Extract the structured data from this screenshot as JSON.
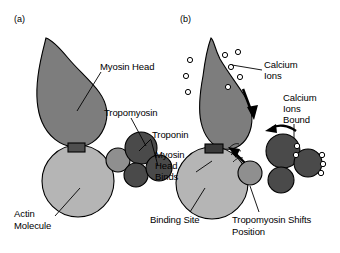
{
  "figure": {
    "background_color": "#ffffff",
    "width": 340,
    "height": 253
  },
  "colors": {
    "myosin_gray": "#7d7d7d",
    "actin_light_gray": "#b5b5b5",
    "troponin_dark": "#4a4a4a",
    "tropomyosin_mid": "#8a8a8a",
    "binding_site_dark": "#3a3a3a",
    "outline": "#000000",
    "text": "#000000"
  },
  "panels": [
    {
      "id": "a",
      "label": "(a)",
      "state": "relaxed",
      "labels": [
        {
          "name": "myosin-head-label",
          "text": "Myosin Head"
        },
        {
          "name": "tropomyosin-label",
          "text": "Tropomyosin"
        },
        {
          "name": "troponin-label",
          "text": "Troponin"
        },
        {
          "name": "actin-molecule-label",
          "text": "Actin\nMolecule"
        }
      ]
    },
    {
      "id": "b",
      "label": "(b)",
      "state": "contracted",
      "labels": [
        {
          "name": "calcium-ions-label",
          "text": "Calcium\nIons"
        },
        {
          "name": "calcium-ions-bound-label",
          "text": "Calcium\nIons\nBound"
        },
        {
          "name": "myosin-head-binds-label",
          "text": "Myosin\nHead\nBinds"
        },
        {
          "name": "binding-site-label",
          "text": "Binding Site"
        },
        {
          "name": "tropomyosin-shifts-label",
          "text": "Tropomyosin Shifts\nPosition"
        }
      ]
    }
  ],
  "text": {
    "panel_a_label": "(a)",
    "panel_b_label": "(b)",
    "myosin_head": "Myosin Head",
    "tropomyosin": "Tropomyosin",
    "troponin": "Troponin",
    "actin_line1": "Actin",
    "actin_line2": "Molecule",
    "calcium_line1": "Calcium",
    "calcium_line2": "Ions",
    "calcium_bound_line1": "Calcium",
    "calcium_bound_line2": "Ions",
    "calcium_bound_line3": "Bound",
    "myosin_binds_line1": "Myosin",
    "myosin_binds_line2": "Head",
    "myosin_binds_line3": "Binds",
    "binding_site": "Binding Site",
    "tropo_shift_line1": "Tropomyosin Shifts",
    "tropo_shift_line2": "Position"
  },
  "elements": {
    "free_calcium_ion_count": 8,
    "bound_calcium_ion_count": 5,
    "troponin_circle_count_a": 4,
    "troponin_circle_count_b": 4,
    "arrows": [
      {
        "name": "calcium-influx-arrow",
        "direction": "down"
      },
      {
        "name": "tropomyosin-shift-arrow",
        "direction": "up-left"
      },
      {
        "name": "myosin-binding-arrow",
        "direction": "up-left"
      }
    ]
  }
}
